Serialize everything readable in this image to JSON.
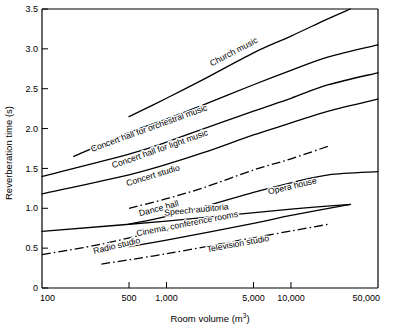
{
  "chart_data": {
    "type": "line",
    "title": "",
    "xlabel": "Room volume (m3)",
    "xlabel_main": "Room volume (m",
    "xlabel_sup": "3",
    "xlabel_tail": ")",
    "ylabel": "Reverberation time (s)",
    "x_scale": "log",
    "xlim": [
      100,
      50000
    ],
    "ylim": [
      0,
      3.5
    ],
    "grid": false,
    "legend": "inline-labels-on-curves",
    "xticks": [
      100,
      500,
      1000,
      5000,
      10000,
      50000
    ],
    "xticklabels": [
      "100",
      "500",
      "1,000",
      "5,000",
      "10,000",
      "50,000"
    ],
    "yticks": [
      0,
      0.5,
      1.0,
      1.5,
      2.0,
      2.5,
      3.0,
      3.5
    ],
    "yticklabels": [
      "0",
      "0.5",
      "1.0",
      "1.5",
      "2.0",
      "2.5",
      "3.0",
      "3.5"
    ],
    "series": [
      {
        "name": "Church music",
        "label": "Church music",
        "style": "solid",
        "x": [
          500,
          1000,
          2000,
          5000,
          10000,
          20000,
          30000
        ],
        "y": [
          2.15,
          2.38,
          2.62,
          2.95,
          3.16,
          3.38,
          3.5
        ]
      },
      {
        "name": "Concert hall for orchestral music",
        "label": "Concert hall for orchestral music",
        "style": "solid",
        "x": [
          180,
          500,
          1000,
          2000,
          5000,
          10000,
          20000,
          50000
        ],
        "y": [
          1.65,
          1.95,
          2.12,
          2.3,
          2.55,
          2.73,
          2.9,
          3.05
        ]
      },
      {
        "name": "Concert hall for light music",
        "label": "Concert hall for light music",
        "style": "solid",
        "x": [
          100,
          500,
          1000,
          2000,
          5000,
          10000,
          20000,
          50000
        ],
        "y": [
          1.4,
          1.68,
          1.83,
          2.0,
          2.22,
          2.38,
          2.55,
          2.7
        ]
      },
      {
        "name": "Concert studio",
        "label": "Concert studio",
        "style": "solid",
        "x": [
          100,
          500,
          1000,
          2000,
          5000,
          10000,
          20000,
          50000
        ],
        "y": [
          1.18,
          1.42,
          1.55,
          1.7,
          1.92,
          2.07,
          2.22,
          2.37
        ]
      },
      {
        "name": "Dance hall",
        "label": "Dance hall",
        "style": "dash-dot",
        "x": [
          500,
          1000,
          2000,
          5000,
          10000,
          20000
        ],
        "y": [
          1.0,
          1.12,
          1.26,
          1.48,
          1.62,
          1.78
        ]
      },
      {
        "name": "Opera house",
        "label": "Opera house",
        "style": "solid",
        "x": [
          500,
          1000,
          2000,
          5000,
          10000,
          20000,
          50000
        ],
        "y": [
          0.8,
          0.9,
          1.02,
          1.2,
          1.32,
          1.42,
          1.46
        ]
      },
      {
        "name": "Speech auditoria",
        "label": "Speech auditoria",
        "style": "solid",
        "x": [
          100,
          1000,
          10000,
          30000
        ],
        "y": [
          0.71,
          0.84,
          0.99,
          1.05
        ]
      },
      {
        "name": "Cinema, conference rooms",
        "label": "Cinema, conference rooms",
        "style": "solid",
        "x": [
          500,
          1000,
          5000,
          10000,
          30000
        ],
        "y": [
          0.52,
          0.6,
          0.81,
          0.91,
          1.05
        ]
      },
      {
        "name": "Radio studio",
        "label": "Radio studio",
        "style": "dash-dot",
        "x": [
          100,
          300,
          1000,
          2000
        ],
        "y": [
          0.42,
          0.55,
          0.74,
          0.84
        ]
      },
      {
        "name": "Television studio",
        "label": "Television studio",
        "style": "dash-dot",
        "x": [
          300,
          1000,
          5000,
          20000
        ],
        "y": [
          0.3,
          0.43,
          0.63,
          0.8
        ]
      }
    ]
  },
  "axes": {
    "y_title": "Reverberation time (s)",
    "x_title_main": "Room volume (m",
    "x_title_sup": "3",
    "x_title_tail": ")"
  },
  "colors": {
    "line": "#000000",
    "background": "#ffffff",
    "axis": "#000000"
  }
}
